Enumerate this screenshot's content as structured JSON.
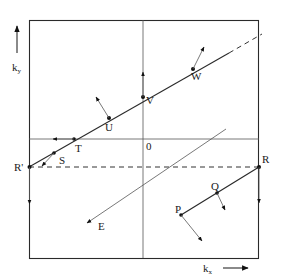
{
  "diagram": {
    "type": "k-space scattering diagram (reciprocal lattice / Brillouin zone)",
    "axes": {
      "x_label": "k",
      "x_subscript": "x",
      "y_label": "k",
      "y_subscript": "y",
      "origin_label": "0"
    },
    "points": [
      {
        "id": "R_prime",
        "label": "R'"
      },
      {
        "id": "S",
        "label": "S"
      },
      {
        "id": "T",
        "label": "T"
      },
      {
        "id": "U",
        "label": "U"
      },
      {
        "id": "V",
        "label": "V"
      },
      {
        "id": "W",
        "label": "W"
      },
      {
        "id": "R",
        "label": "R"
      },
      {
        "id": "Q",
        "label": "Q"
      },
      {
        "id": "P",
        "label": "P"
      },
      {
        "id": "E",
        "label": "E"
      }
    ],
    "colors": {
      "line": "#2a2a2a",
      "background": "#ffffff"
    }
  }
}
